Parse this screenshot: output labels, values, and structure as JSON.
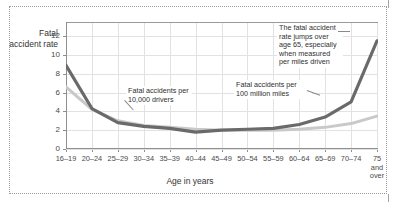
{
  "figure": {
    "y_axis_title": "Fatal accident rate",
    "x_axis_title": "Age in years"
  },
  "annotations": {
    "drivers": "Fatal accidents per 10,000 drivers",
    "miles": "Fatal accidents per 100 million miles",
    "jump": "The fatal accident rate jumps over age 65, especially when measured per miles driven"
  },
  "colors": {
    "series_miles": "#6a6a6a",
    "series_drivers": "#c9c9c9",
    "grid": "#e2e2e2",
    "axis": "#8f8f8f",
    "frame": "#9b9b9b"
  },
  "chart_data": {
    "type": "line",
    "title": "",
    "xlabel": "Age in years",
    "ylabel": "Fatal accident rate",
    "ylim": [
      0,
      13.5
    ],
    "yticks": [
      0,
      2,
      4,
      6,
      8,
      10,
      12
    ],
    "grid": true,
    "legend": "annotated-inline",
    "categories": [
      "16–19",
      "20–24",
      "25–29",
      "30–34",
      "35–39",
      "40–44",
      "45–49",
      "50–54",
      "55–59",
      "60–64",
      "65–69",
      "70–74",
      "75\nand\nover"
    ],
    "series": [
      {
        "name": "Fatal accidents per 100 million miles",
        "color": "#6a6a6a",
        "values": [
          8.9,
          4.3,
          2.8,
          2.4,
          2.2,
          1.8,
          2.0,
          2.1,
          2.2,
          2.6,
          3.4,
          5.0,
          11.5
        ]
      },
      {
        "name": "Fatal accidents per 10,000 drivers",
        "color": "#c9c9c9",
        "values": [
          6.6,
          4.2,
          3.0,
          2.5,
          2.3,
          2.1,
          2.0,
          2.0,
          2.0,
          2.1,
          2.3,
          2.7,
          3.5
        ]
      }
    ]
  }
}
